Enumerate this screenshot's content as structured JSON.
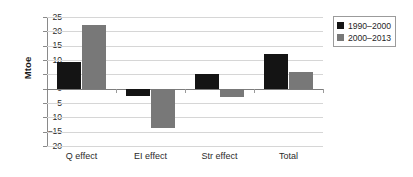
{
  "chart_data": {
    "type": "bar",
    "title": "",
    "subtitle": "",
    "xlabel": "",
    "ylabel": "Mtoe",
    "categories": [
      "Q effect",
      "EI effect",
      "Str effect",
      "Total"
    ],
    "series": [
      {
        "name": "1990–2000",
        "color": "#141414",
        "values": [
          9.2,
          -2.7,
          5.2,
          12.0
        ]
      },
      {
        "name": "2000–2013",
        "color": "#787878",
        "values": [
          22.3,
          -13.7,
          -2.9,
          5.8
        ]
      }
    ],
    "ylim": [
      -20,
      25
    ],
    "ytick_step": 5,
    "yticks": [
      25,
      20,
      15,
      10,
      5,
      0,
      -5,
      -10,
      -15,
      -20
    ],
    "ytick_labels": [
      "25",
      "20",
      "15",
      "10",
      "5",
      "0",
      "−5",
      "−10",
      "−15",
      "−20"
    ],
    "grid": true,
    "grid_axis": "y",
    "legend_position": "top-right",
    "legend_border": true,
    "zero_line": true
  },
  "axis": {
    "y_title": "Mtoe"
  },
  "legend": {
    "entries": [
      {
        "label": "1990–2000",
        "swatch_color": "#141414"
      },
      {
        "label": "2000–2013",
        "swatch_color": "#787878"
      }
    ]
  },
  "colors": {
    "series_1990_2000": "#141414",
    "series_2000_2013": "#787878",
    "gridline": "#d6d6d6",
    "axis_line": "#8a8a8a",
    "background": "#ffffff"
  }
}
